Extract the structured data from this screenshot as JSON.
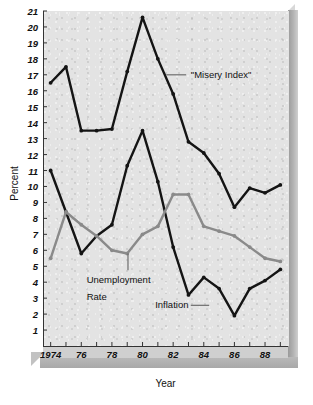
{
  "chart_data": {
    "type": "line",
    "title": "",
    "xlabel": "Year",
    "ylabel": "Percent",
    "x": [
      1974,
      1975,
      1976,
      1977,
      1978,
      1979,
      1980,
      1981,
      1982,
      1983,
      1984,
      1985,
      1986,
      1987,
      1988,
      1989
    ],
    "xlim": [
      1973.5,
      1989.5
    ],
    "ylim": [
      0,
      21
    ],
    "yticks": [
      1,
      2,
      3,
      4,
      5,
      6,
      7,
      8,
      9,
      10,
      11,
      12,
      13,
      14,
      15,
      16,
      17,
      18,
      19,
      20,
      21
    ],
    "xticks_major": [
      1974,
      1976,
      1978,
      1980,
      1982,
      1984,
      1986,
      1988
    ],
    "xtick_labels": [
      "1974",
      "76",
      "78",
      "80",
      "82",
      "84",
      "86",
      "88"
    ],
    "grid": false,
    "legend_position": "inline-annotations",
    "series": [
      {
        "name": "\"Misery Index\"",
        "color": "#141414",
        "values": [
          16.5,
          17.5,
          13.5,
          13.5,
          13.6,
          17.2,
          20.6,
          18.0,
          15.8,
          12.8,
          12.1,
          10.8,
          8.7,
          9.9,
          9.6,
          10.1
        ]
      },
      {
        "name": "Inflation",
        "color": "#141414",
        "values": [
          11.0,
          8.4,
          5.8,
          6.9,
          7.6,
          11.3,
          13.5,
          10.3,
          6.2,
          3.2,
          4.3,
          3.6,
          1.9,
          3.6,
          4.1,
          4.8
        ]
      },
      {
        "name": "Unemployment Rate",
        "color": "#8a8a8a",
        "values": [
          5.5,
          8.4,
          7.6,
          6.9,
          6.0,
          5.8,
          7.0,
          7.5,
          9.5,
          9.5,
          7.5,
          7.2,
          6.9,
          6.2,
          5.5,
          5.3
        ]
      }
    ],
    "annotations": [
      {
        "text": "\"Misery Index\"",
        "x": 1983.2,
        "y": 17.0
      },
      {
        "text": "Unemployment",
        "x": 1976.5,
        "y": 4.3
      },
      {
        "text": "Rate",
        "x": 1976.5,
        "y": 3.2
      },
      {
        "text": "Inflation",
        "x": 1982.4,
        "y": 2.6
      }
    ]
  },
  "axes": {
    "y_title": "Percent",
    "x_title": "Year"
  },
  "labels": {
    "misery_index": "\"Misery Index\"",
    "unemployment_line1": "Unemployment",
    "unemployment_line2": "Rate",
    "inflation": "Inflation"
  },
  "colors": {
    "line_dark": "#141414",
    "line_gray": "#8a8a8a",
    "panel": "#e3e3e3",
    "frame": "#b4b4b4"
  }
}
